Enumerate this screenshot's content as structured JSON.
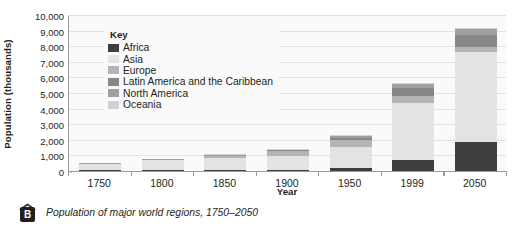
{
  "chart_data": {
    "type": "bar",
    "stacked": true,
    "title": "",
    "xlabel": "Year",
    "ylabel": "Population (thousands)",
    "ylim": [
      0,
      10000
    ],
    "ytick_labels": [
      "0",
      "1,000",
      "2,000",
      "3,000",
      "4,000",
      "5,000",
      "6,000",
      "7,000",
      "8,000",
      "9,000",
      "10,000"
    ],
    "ytick_values": [
      0,
      1000,
      2000,
      3000,
      4000,
      5000,
      6000,
      7000,
      8000,
      9000,
      10000
    ],
    "grid": true,
    "legend_position": "inside-top-left",
    "legend_title": "Key",
    "categories": [
      "1750",
      "1800",
      "1850",
      "1900",
      "1950",
      "1999",
      "2050"
    ],
    "series": [
      {
        "name": "Africa",
        "color": "#3f3f42",
        "values": [
          100,
          110,
          110,
          130,
          230,
          770,
          1900
        ]
      },
      {
        "name": "Asia",
        "color": "#e3e3e3",
        "values": [
          410,
          630,
          800,
          920,
          1400,
          3630,
          5800
        ]
      },
      {
        "name": "Europe",
        "color": "#b4b4b6",
        "values": [
          60,
          90,
          140,
          270,
          400,
          480,
          320
        ]
      },
      {
        "name": "Latin America and the Caribbean",
        "color": "#878789",
        "values": [
          20,
          20,
          40,
          70,
          170,
          510,
          780
        ]
      },
      {
        "name": "North America",
        "color": "#a0a0a2",
        "values": [
          10,
          10,
          30,
          80,
          170,
          310,
          390
        ]
      },
      {
        "name": "Oceania",
        "color": "#d2d2d4",
        "values": [
          5,
          5,
          10,
          10,
          20,
          30,
          50
        ]
      }
    ]
  },
  "caption": {
    "badge_label": "B",
    "text": "Population of major world regions, 1750–2050"
  }
}
